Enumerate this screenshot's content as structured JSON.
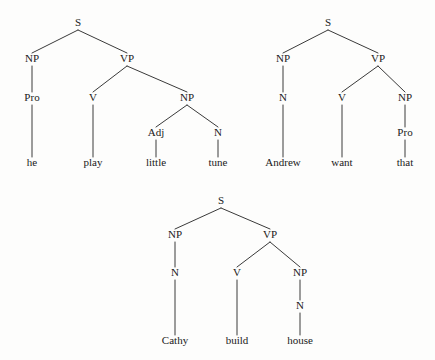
{
  "figure": {
    "type": "syntax-tree-diagram",
    "background_color": "#fdfdfc",
    "ink_color": "#1a1a1a",
    "trees": [
      {
        "id": "tree-1",
        "sentence": "he play little tune",
        "nodes": [
          {
            "id": "t1-s",
            "label": "S",
            "x": 78,
            "y": 26,
            "kind": "nonterminal"
          },
          {
            "id": "t1-np1",
            "label": "NP",
            "x": 32,
            "y": 62,
            "kind": "nonterminal"
          },
          {
            "id": "t1-vp",
            "label": "VP",
            "x": 127,
            "y": 62,
            "kind": "nonterminal"
          },
          {
            "id": "t1-pro",
            "label": "Pro",
            "x": 32,
            "y": 101,
            "kind": "preterminal"
          },
          {
            "id": "t1-v",
            "label": "V",
            "x": 93,
            "y": 101,
            "kind": "preterminal"
          },
          {
            "id": "t1-np2",
            "label": "NP",
            "x": 187,
            "y": 101,
            "kind": "nonterminal"
          },
          {
            "id": "t1-adj",
            "label": "Adj",
            "x": 156,
            "y": 136,
            "kind": "preterminal"
          },
          {
            "id": "t1-n",
            "label": "N",
            "x": 218,
            "y": 136,
            "kind": "preterminal"
          },
          {
            "id": "t1-he",
            "label": "he",
            "x": 32,
            "y": 166,
            "kind": "leaf"
          },
          {
            "id": "t1-play",
            "label": "play",
            "x": 93,
            "y": 166,
            "kind": "leaf"
          },
          {
            "id": "t1-little",
            "label": "little",
            "x": 156,
            "y": 166,
            "kind": "leaf"
          },
          {
            "id": "t1-tune",
            "label": "tune",
            "x": 218,
            "y": 166,
            "kind": "leaf"
          }
        ],
        "edges": [
          [
            "t1-s",
            "t1-np1"
          ],
          [
            "t1-s",
            "t1-vp"
          ],
          [
            "t1-np1",
            "t1-pro"
          ],
          [
            "t1-vp",
            "t1-v"
          ],
          [
            "t1-vp",
            "t1-np2"
          ],
          [
            "t1-np2",
            "t1-adj"
          ],
          [
            "t1-np2",
            "t1-n"
          ],
          [
            "t1-pro",
            "t1-he"
          ],
          [
            "t1-v",
            "t1-play"
          ],
          [
            "t1-adj",
            "t1-little"
          ],
          [
            "t1-n",
            "t1-tune"
          ]
        ]
      },
      {
        "id": "tree-2",
        "sentence": "Andrew want that",
        "nodes": [
          {
            "id": "t2-s",
            "label": "S",
            "x": 328,
            "y": 26,
            "kind": "nonterminal"
          },
          {
            "id": "t2-np1",
            "label": "NP",
            "x": 283,
            "y": 62,
            "kind": "nonterminal"
          },
          {
            "id": "t2-vp",
            "label": "VP",
            "x": 378,
            "y": 62,
            "kind": "nonterminal"
          },
          {
            "id": "t2-n",
            "label": "N",
            "x": 283,
            "y": 101,
            "kind": "preterminal"
          },
          {
            "id": "t2-v",
            "label": "V",
            "x": 342,
            "y": 101,
            "kind": "preterminal"
          },
          {
            "id": "t2-np2",
            "label": "NP",
            "x": 405,
            "y": 101,
            "kind": "nonterminal"
          },
          {
            "id": "t2-pro",
            "label": "Pro",
            "x": 405,
            "y": 136,
            "kind": "preterminal"
          },
          {
            "id": "t2-andrew",
            "label": "Andrew",
            "x": 283,
            "y": 166,
            "kind": "leaf"
          },
          {
            "id": "t2-want",
            "label": "want",
            "x": 342,
            "y": 166,
            "kind": "leaf"
          },
          {
            "id": "t2-that",
            "label": "that",
            "x": 405,
            "y": 166,
            "kind": "leaf"
          }
        ],
        "edges": [
          [
            "t2-s",
            "t2-np1"
          ],
          [
            "t2-s",
            "t2-vp"
          ],
          [
            "t2-np1",
            "t2-n"
          ],
          [
            "t2-vp",
            "t2-v"
          ],
          [
            "t2-vp",
            "t2-np2"
          ],
          [
            "t2-np2",
            "t2-pro"
          ],
          [
            "t2-n",
            "t2-andrew"
          ],
          [
            "t2-v",
            "t2-want"
          ],
          [
            "t2-pro",
            "t2-that"
          ]
        ]
      },
      {
        "id": "tree-3",
        "sentence": "Cathy build house",
        "nodes": [
          {
            "id": "t3-s",
            "label": "S",
            "x": 221,
            "y": 204,
            "kind": "nonterminal"
          },
          {
            "id": "t3-np1",
            "label": "NP",
            "x": 175,
            "y": 238,
            "kind": "nonterminal"
          },
          {
            "id": "t3-vp",
            "label": "VP",
            "x": 270,
            "y": 238,
            "kind": "nonterminal"
          },
          {
            "id": "t3-n1",
            "label": "N",
            "x": 175,
            "y": 276,
            "kind": "preterminal"
          },
          {
            "id": "t3-v",
            "label": "V",
            "x": 237,
            "y": 276,
            "kind": "preterminal"
          },
          {
            "id": "t3-np2",
            "label": "NP",
            "x": 300,
            "y": 276,
            "kind": "nonterminal"
          },
          {
            "id": "t3-n2",
            "label": "N",
            "x": 300,
            "y": 309,
            "kind": "preterminal"
          },
          {
            "id": "t3-cathy",
            "label": "Cathy",
            "x": 175,
            "y": 344,
            "kind": "leaf"
          },
          {
            "id": "t3-build",
            "label": "build",
            "x": 237,
            "y": 344,
            "kind": "leaf"
          },
          {
            "id": "t3-house",
            "label": "house",
            "x": 300,
            "y": 344,
            "kind": "leaf"
          }
        ],
        "edges": [
          [
            "t3-s",
            "t3-np1"
          ],
          [
            "t3-s",
            "t3-vp"
          ],
          [
            "t3-np1",
            "t3-n1"
          ],
          [
            "t3-vp",
            "t3-v"
          ],
          [
            "t3-vp",
            "t3-np2"
          ],
          [
            "t3-np2",
            "t3-n2"
          ],
          [
            "t3-n1",
            "t3-cathy"
          ],
          [
            "t3-v",
            "t3-build"
          ],
          [
            "t3-n2",
            "t3-house"
          ]
        ]
      }
    ]
  }
}
